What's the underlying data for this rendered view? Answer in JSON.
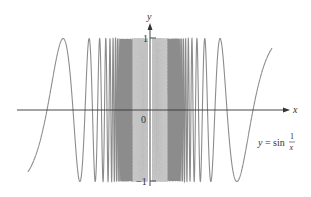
{
  "chart_data": {
    "type": "line",
    "title": "",
    "function": "y = sin(1/x)",
    "xlabel": "x",
    "ylabel": "y",
    "ylim": [
      -1,
      1
    ],
    "xlim": [
      -0.476,
      0.476
    ],
    "grid": false,
    "legend": null,
    "tick_labels": {
      "y_top": "1",
      "y_bottom": "−1",
      "origin": "0"
    },
    "annotation": {
      "lhs": "y = sin",
      "frac_num": "1",
      "frac_den": "x"
    },
    "series": [
      {
        "name": "sin(1/x)",
        "description": "oscillates infinitely often between -1 and 1 as x approaches 0; rendered dashed/faded near the origin",
        "zeros_x": [
          -0.318,
          -0.159,
          -0.106,
          0.106,
          0.159,
          0.318
        ]
      }
    ],
    "colors": {
      "curve": "#8c8c8c",
      "curve_near_origin": "#c8c8c8",
      "axis": "#333333"
    }
  }
}
